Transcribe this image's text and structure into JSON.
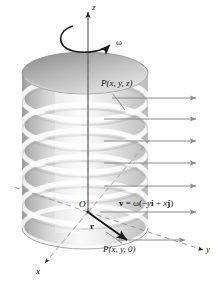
{
  "figure": {
    "background_color": "#ffffff",
    "ink_color": "#111111",
    "arrow_color": "#8a8a8a",
    "dash_color": "#9a9a9a",
    "cylinder_fill_light": "#fdfdfd",
    "cylinder_fill_mid": "#d8d8d8",
    "cylinder_fill_dark": "#9e9e9e"
  },
  "labels": {
    "z_axis": "z",
    "x_axis": "x",
    "y_axis": "y",
    "omega": "ω",
    "origin": "O",
    "point_top": "P(x, y, z)",
    "point_base": "P(x, y, 0)",
    "radius_vector": "r",
    "velocity_equation_v": "v",
    "velocity_equation_eq": " = ",
    "velocity_equation_omega": "ω(−",
    "velocity_equation_y": "y",
    "velocity_equation_i": "i",
    "velocity_equation_plus": " + ",
    "velocity_equation_x": "x",
    "velocity_equation_j": "j",
    "velocity_equation_close": ")",
    "velocity_equation_full": "v = ω(−yi + xj)"
  },
  "geometry": {
    "cylinder": {
      "center_x": 85,
      "top_y": 73,
      "bottom_y": 228,
      "radius_x": 63,
      "radius_y": 21
    },
    "band_count": 6,
    "velocity_arrow_ys": [
      98,
      119,
      141,
      163,
      186,
      208,
      237
    ],
    "velocity_arrow_tip_x": 197,
    "origin": {
      "x": 88,
      "y": 212
    },
    "point_base": {
      "x": 128,
      "y": 241
    }
  }
}
